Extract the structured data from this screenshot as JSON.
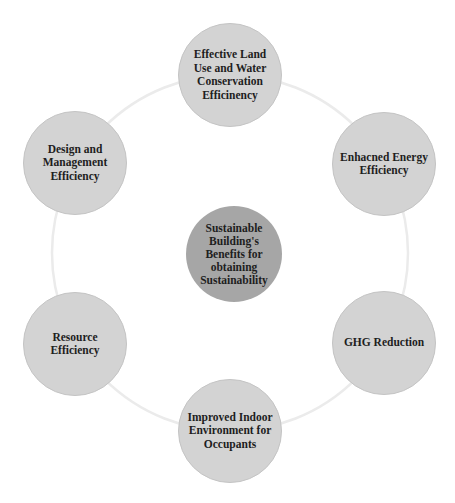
{
  "diagram": {
    "type": "radial-cycle",
    "colors": {
      "background": "#ffffff",
      "ring": "#ebebeb",
      "outer_node_fill": "#d3d3d3",
      "outer_node_border": "#c4c4c4",
      "center_node_fill": "#a6a6a6",
      "text": "#1e1e1e"
    },
    "center": {
      "label": "Sustainable Building's Benefits for obtaining Sustainability"
    },
    "nodes": [
      {
        "label": "Effective Land Use and Water Conservation Efficinency",
        "position": "top"
      },
      {
        "label": "Enhacned Energy Efficiency",
        "position": "upper-right"
      },
      {
        "label": "GHG Reduction",
        "position": "lower-right"
      },
      {
        "label": "Improved Indoor Environment for Occupants",
        "position": "bottom"
      },
      {
        "label": "Resource Efficiency",
        "position": "lower-left"
      },
      {
        "label": "Design and Management Efficiency",
        "position": "upper-left"
      }
    ]
  }
}
